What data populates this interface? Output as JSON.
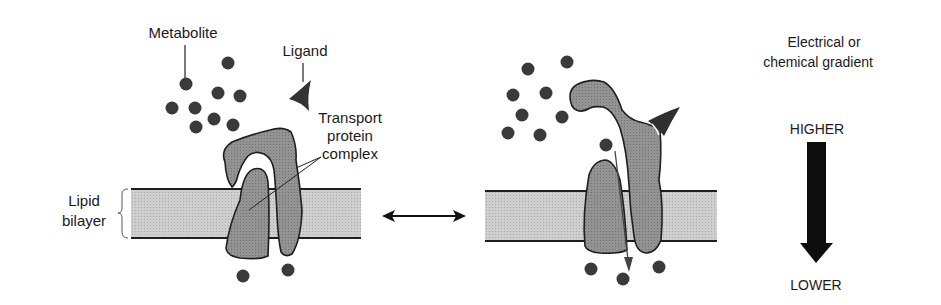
{
  "diagram": {
    "colors": {
      "protein_fill": "#8c8c8c",
      "bilayer_fill": "#c8c8c8",
      "metabolite": "#3a3a3a",
      "ligand": "#333333",
      "outline": "#1e1e1e",
      "arrow": "#111111"
    },
    "labels": {
      "metabolite": "Metabolite",
      "ligand": "Ligand",
      "transport_line1": "Transport",
      "transport_line2": "protein",
      "transport_line3": "complex",
      "lipid_line1": "Lipid",
      "lipid_line2": "bilayer",
      "gradient_line1": "Electrical or",
      "gradient_line2": "chemical gradient",
      "higher": "HIGHER",
      "lower": "LOWER"
    },
    "left_panel": {
      "state": "closed (no ligand bound)",
      "metabolites_above": 9,
      "metabolites_below": 2
    },
    "right_panel": {
      "state": "open (ligand bound), metabolite passing through",
      "metabolites_above": 9,
      "metabolites_below": 3
    },
    "equilibrium_arrow": "double-headed",
    "gradient_arrow": "downward from HIGHER to LOWER"
  }
}
